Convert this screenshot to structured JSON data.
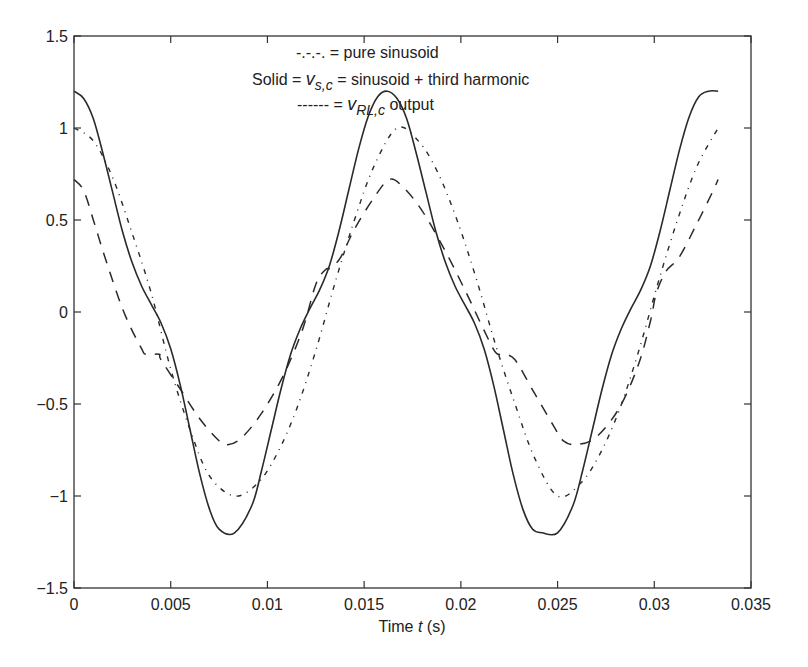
{
  "chart_data": {
    "type": "line",
    "title": "",
    "xlabel_prefix": "Time ",
    "xlabel_var": "t",
    "xlabel_suffix": " (s)",
    "ylabel": "",
    "xlim": [
      0,
      0.035
    ],
    "ylim": [
      -1.5,
      1.5
    ],
    "grid": false,
    "x_ticks": [
      0,
      0.005,
      0.01,
      0.015,
      0.02,
      0.025,
      0.03,
      0.035
    ],
    "x_tick_labels": [
      "0",
      "0.005",
      "0.01",
      "0.015",
      "0.02",
      "0.025",
      "0.03",
      "0.035"
    ],
    "y_ticks": [
      1.5,
      1,
      0.5,
      0,
      -0.5,
      -1,
      -1.5
    ],
    "y_tick_labels": [
      "1.5",
      "1",
      "0.5",
      "0",
      "−0.5",
      "−1",
      "−1.5"
    ],
    "legend": {
      "placement": "top-right",
      "entries": [
        {
          "marker": "-.-.-.",
          "text": " = pure sinusoid"
        },
        {
          "prefix": "Solid = ",
          "var": "v",
          "sub": "s,c",
          "text": " = sinusoid + third harmonic"
        },
        {
          "marker": "------ = ",
          "var": "v",
          "sub": "RL,c",
          "text": " output"
        }
      ]
    },
    "series": [
      {
        "name": "pure sinusoid",
        "style": "dashdot",
        "t": [
          0,
          0.001,
          0.002,
          0.003,
          0.004,
          0.005,
          0.006,
          0.007,
          0.0083,
          0.0095,
          0.0105,
          0.0115,
          0.0125,
          0.0135,
          0.0145,
          0.0155,
          0.0167,
          0.0178,
          0.0188,
          0.0198,
          0.0208,
          0.0218,
          0.0228,
          0.0238,
          0.025,
          0.0262,
          0.0272,
          0.0282,
          0.0292,
          0.0302,
          0.0312,
          0.0322,
          0.0333
        ],
        "y": [
          1.0,
          0.93,
          0.73,
          0.43,
          0.1,
          -0.31,
          -0.64,
          -0.89,
          -1.0,
          -0.93,
          -0.77,
          -0.53,
          -0.21,
          0.16,
          0.5,
          0.79,
          1.0,
          0.93,
          0.76,
          0.5,
          0.18,
          -0.18,
          -0.5,
          -0.79,
          -1.0,
          -0.93,
          -0.77,
          -0.53,
          -0.21,
          0.16,
          0.5,
          0.79,
          1.0
        ]
      },
      {
        "name": "sinusoid + third harmonic (v_s,c)",
        "style": "solid",
        "t": [
          0,
          0.0005,
          0.001,
          0.0015,
          0.002,
          0.0025,
          0.003,
          0.0035,
          0.004,
          0.0045,
          0.005,
          0.0055,
          0.006,
          0.0065,
          0.007,
          0.0075,
          0.0083,
          0.0092,
          0.0097,
          0.0102,
          0.0107,
          0.0112,
          0.0117,
          0.0122,
          0.0127,
          0.0132,
          0.0137,
          0.0142,
          0.0147,
          0.0152,
          0.0157,
          0.0162,
          0.0167,
          0.0172,
          0.0177,
          0.0182,
          0.0187,
          0.0192,
          0.0197,
          0.0202,
          0.0207,
          0.0212,
          0.0217,
          0.0222,
          0.0227,
          0.0232,
          0.0237,
          0.0242,
          0.025,
          0.0258,
          0.0263,
          0.0268,
          0.0273,
          0.0278,
          0.0283,
          0.0288,
          0.0293,
          0.0298,
          0.0303,
          0.0308,
          0.0313,
          0.0318,
          0.0323,
          0.0328,
          0.0333
        ],
        "y": [
          1.2,
          1.16,
          1.05,
          0.86,
          0.65,
          0.44,
          0.27,
          0.14,
          0.04,
          -0.06,
          -0.2,
          -0.4,
          -0.64,
          -0.88,
          -1.07,
          -1.18,
          -1.2,
          -1.05,
          -0.86,
          -0.64,
          -0.42,
          -0.23,
          -0.09,
          0.02,
          0.12,
          0.25,
          0.44,
          0.66,
          0.88,
          1.06,
          1.17,
          1.2,
          1.16,
          1.05,
          0.86,
          0.65,
          0.44,
          0.27,
          0.14,
          0.04,
          -0.06,
          -0.2,
          -0.4,
          -0.64,
          -0.88,
          -1.07,
          -1.18,
          -1.2,
          -1.2,
          -1.05,
          -0.86,
          -0.64,
          -0.42,
          -0.23,
          -0.09,
          0.02,
          0.12,
          0.25,
          0.44,
          0.66,
          0.88,
          1.06,
          1.17,
          1.2,
          1.2
        ]
      },
      {
        "name": "v_RL,c output",
        "style": "dashed",
        "t": [
          0,
          0.0005,
          0.001,
          0.0015,
          0.002,
          0.0025,
          0.003,
          0.0035,
          0.0037,
          0.0044,
          0.0045,
          0.0055,
          0.0065,
          0.0075,
          0.008,
          0.0087,
          0.0097,
          0.0108,
          0.0118,
          0.0125,
          0.013,
          0.0133,
          0.0138,
          0.0145,
          0.0155,
          0.0163,
          0.017,
          0.018,
          0.0192,
          0.0203,
          0.0212,
          0.0218,
          0.0222,
          0.0228,
          0.0238,
          0.0248,
          0.0253,
          0.026,
          0.027,
          0.0282,
          0.0292,
          0.0298,
          0.0301,
          0.0306,
          0.0313,
          0.0322,
          0.033,
          0.0333
        ],
        "y": [
          0.72,
          0.66,
          0.5,
          0.33,
          0.17,
          0.02,
          -0.1,
          -0.2,
          -0.23,
          -0.23,
          -0.26,
          -0.42,
          -0.58,
          -0.7,
          -0.72,
          -0.68,
          -0.55,
          -0.35,
          -0.1,
          0.15,
          0.23,
          0.24,
          0.3,
          0.45,
          0.62,
          0.72,
          0.68,
          0.55,
          0.33,
          0.1,
          -0.1,
          -0.22,
          -0.23,
          -0.26,
          -0.44,
          -0.62,
          -0.7,
          -0.72,
          -0.68,
          -0.52,
          -0.28,
          -0.05,
          0.1,
          0.22,
          0.3,
          0.48,
          0.65,
          0.72
        ]
      }
    ]
  }
}
